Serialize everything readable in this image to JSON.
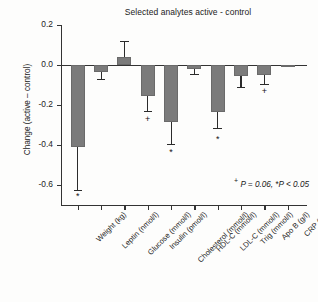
{
  "chart_data": {
    "type": "bar",
    "title": "Selected analytes active - control",
    "xlabel": "",
    "ylabel": "Change (active – control)",
    "ylim": [
      -0.7,
      0.2
    ],
    "yticks": [
      0.2,
      0.0,
      -0.2,
      -0.4,
      -0.6
    ],
    "ytick_labels": [
      "0.2",
      "0.0",
      "-0.2",
      "-0.4",
      "-0.6"
    ],
    "grid": false,
    "legend": "none",
    "bar_color": "#7b7b7b",
    "categories": [
      "Weight (kg)",
      "Leptin (nmol/l)",
      "Glucose (mmol/l)",
      "Insulin (pmol/l)",
      "Cholesterol (mmol/l)",
      "HDL-C (mmol/l)",
      "LDL-C (mmol/l)",
      "Trig (mmol/l)",
      "Apo B (g/l)",
      "CRP (g/l)"
    ],
    "values": [
      -0.41,
      -0.035,
      0.04,
      -0.155,
      -0.285,
      -0.02,
      -0.235,
      -0.055,
      -0.05,
      -0.005
    ],
    "errors_low": [
      -0.625,
      -0.07,
      0.04,
      -0.23,
      -0.395,
      -0.045,
      -0.315,
      -0.11,
      -0.095,
      -0.005
    ],
    "errors_high": [
      -0.41,
      -0.035,
      0.12,
      -0.155,
      -0.285,
      -0.02,
      -0.235,
      -0.055,
      -0.05,
      -0.005
    ],
    "significance": [
      "*",
      "",
      "",
      "+",
      "*",
      "",
      "*",
      "",
      "+",
      ""
    ],
    "significance_y": [
      -0.66,
      null,
      null,
      -0.275,
      -0.44,
      null,
      -0.375,
      null,
      -0.135,
      null
    ],
    "annotations": {
      "footnote_marker_trend": "+",
      "footnote_trend": " P = 0.06,  ",
      "footnote_marker_sig": "*",
      "footnote_sig": "P < 0.05"
    }
  }
}
